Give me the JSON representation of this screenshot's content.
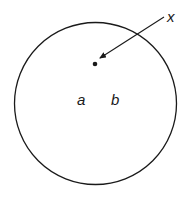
{
  "diagram": {
    "circle": {
      "cx": 95.5,
      "cy": 103.5,
      "r": 81,
      "stroke": "#1a1a1a"
    },
    "point": {
      "cx": 95,
      "cy": 64
    },
    "arrow": {
      "x1": 164,
      "y1": 17,
      "x2": 100,
      "y2": 58
    },
    "labels": {
      "x": "x",
      "a": "a",
      "b": "b"
    }
  }
}
